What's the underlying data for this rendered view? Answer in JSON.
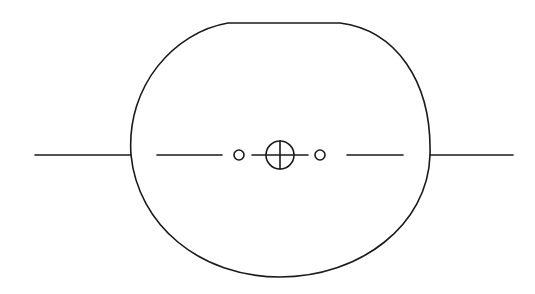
{
  "diagram": {
    "colors": {
      "stroke": "#1a1a1a",
      "background": "#ffffff"
    },
    "elements": [
      {
        "id": "outline",
        "type": "rounded-D-shape"
      },
      {
        "id": "axis-left-outer",
        "type": "line"
      },
      {
        "id": "axis-left-inner",
        "type": "line"
      },
      {
        "id": "center-crosshair",
        "type": "circle-with-cross"
      },
      {
        "id": "small-circle-left",
        "type": "circle"
      },
      {
        "id": "small-circle-right",
        "type": "circle"
      },
      {
        "id": "axis-right-inner",
        "type": "line"
      },
      {
        "id": "axis-right-outer",
        "type": "line"
      }
    ]
  }
}
